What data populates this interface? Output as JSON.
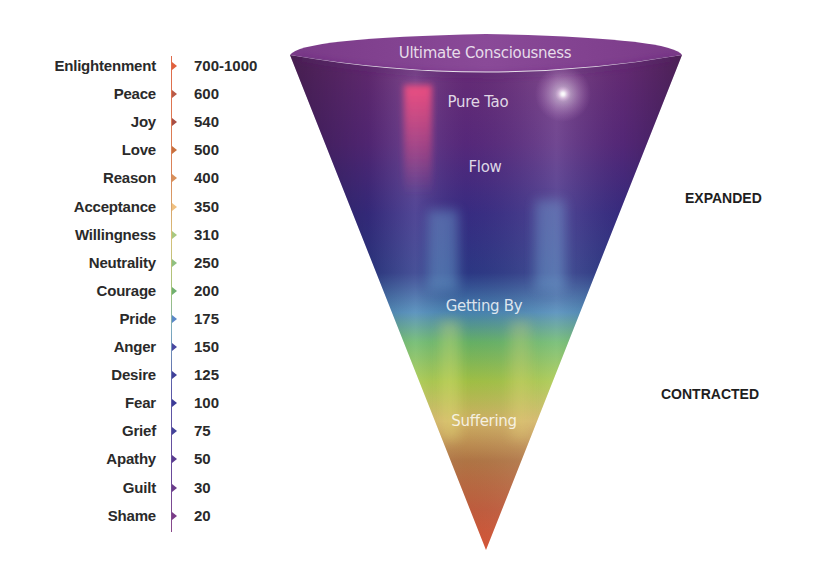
{
  "scale": {
    "levels": [
      {
        "name": "Enlightenment",
        "value": "700-1000",
        "color": "#e0603e"
      },
      {
        "name": "Peace",
        "value": "600",
        "color": "#b85a48"
      },
      {
        "name": "Joy",
        "value": "540",
        "color": "#a84e44"
      },
      {
        "name": "Love",
        "value": "500",
        "color": "#c8703e"
      },
      {
        "name": "Reason",
        "value": "400",
        "color": "#d8905a"
      },
      {
        "name": "Acceptance",
        "value": "350",
        "color": "#f0c080"
      },
      {
        "name": "Willingness",
        "value": "310",
        "color": "#a8c880"
      },
      {
        "name": "Neutrality",
        "value": "250",
        "color": "#90c080"
      },
      {
        "name": "Courage",
        "value": "200",
        "color": "#70b070"
      },
      {
        "name": "Pride",
        "value": "175",
        "color": "#5a88c8"
      },
      {
        "name": "Anger",
        "value": "150",
        "color": "#4848a0"
      },
      {
        "name": "Desire",
        "value": "125",
        "color": "#40409a"
      },
      {
        "name": "Fear",
        "value": "100",
        "color": "#3c3c98"
      },
      {
        "name": "Grief",
        "value": "75",
        "color": "#44449a"
      },
      {
        "name": "Apathy",
        "value": "50",
        "color": "#5a3c90"
      },
      {
        "name": "Guilt",
        "value": "30",
        "color": "#6a3c8a"
      },
      {
        "name": "Shame",
        "value": "20",
        "color": "#7a3c88"
      }
    ]
  },
  "cone": {
    "labels": [
      {
        "text": "Ultimate Consciousness",
        "x": 485,
        "y": 44
      },
      {
        "text": "Pure Tao",
        "x": 478,
        "y": 93
      },
      {
        "text": "Flow",
        "x": 485,
        "y": 158
      },
      {
        "text": "Getting By",
        "x": 484,
        "y": 297
      },
      {
        "text": "Suffering",
        "x": 484,
        "y": 412
      }
    ]
  },
  "side_labels": {
    "expanded": "EXPANDED",
    "contracted": "CONTRACTED"
  }
}
